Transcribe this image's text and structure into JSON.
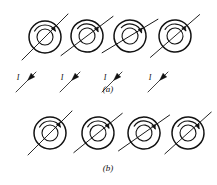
{
  "figure": {
    "type": "physics-diagram",
    "background_color": "#ffffff",
    "stroke_color": "#111111",
    "panels": [
      {
        "id": "a",
        "caption": "(a)",
        "caption_x": 108,
        "caption_y": 89,
        "row_center_y": 37,
        "has_current_arrows": true,
        "current_label": "I",
        "dipoles": [
          {
            "cx": 45,
            "cy": 37,
            "outer_r": 16,
            "inner_r": 8,
            "axis_angle_deg": -45,
            "axis_x1": 22,
            "axis_y1": 60,
            "axis_x2": 68,
            "axis_y2": 14,
            "arc_start_deg": 210,
            "arc_end_deg": 330,
            "arc_r": 12,
            "tilt_deg": 0
          },
          {
            "cx": 87,
            "cy": 36,
            "outer_r": 16,
            "inner_r": 8,
            "axis_angle_deg": -45,
            "axis_x1": 64,
            "axis_y1": 59,
            "axis_x2": 110,
            "axis_y2": 13,
            "arc_start_deg": 210,
            "arc_end_deg": 330,
            "arc_r": 12,
            "tilt_deg": 8
          },
          {
            "cx": 130,
            "cy": 36,
            "outer_r": 16,
            "inner_r": 8,
            "axis_angle_deg": -45,
            "axis_x1": 107,
            "axis_y1": 59,
            "axis_x2": 153,
            "axis_y2": 13,
            "arc_start_deg": 210,
            "arc_end_deg": 330,
            "arc_r": 12,
            "tilt_deg": 14
          },
          {
            "cx": 175,
            "cy": 36,
            "outer_r": 16,
            "inner_r": 8,
            "axis_angle_deg": -45,
            "axis_x1": 152,
            "axis_y1": 59,
            "axis_x2": 198,
            "axis_y2": 13,
            "arc_start_deg": 210,
            "arc_end_deg": 330,
            "arc_r": 12,
            "tilt_deg": 4
          }
        ],
        "current_arrows": [
          {
            "x1": 36,
            "y1": 72,
            "x2": 16,
            "y2": 92,
            "label_x": 14,
            "label_y": 73
          },
          {
            "x1": 80,
            "y1": 72,
            "x2": 60,
            "y2": 92,
            "label_x": 58,
            "label_y": 73
          },
          {
            "x1": 122,
            "y1": 72,
            "x2": 102,
            "y2": 92,
            "label_x": 101,
            "label_y": 73
          },
          {
            "x1": 168,
            "y1": 72,
            "x2": 148,
            "y2": 92,
            "label_x": 146,
            "label_y": 73
          }
        ]
      },
      {
        "id": "b",
        "caption": "(b)",
        "caption_x": 108,
        "caption_y": 168,
        "row_center_y": 133,
        "has_current_arrows": false,
        "current_label": "",
        "dipoles": [
          {
            "cx": 50,
            "cy": 133,
            "outer_r": 16,
            "inner_r": 8,
            "axis_angle_deg": -45,
            "axis_x1": 28,
            "axis_y1": 155,
            "axis_x2": 72,
            "axis_y2": 111,
            "arc_start_deg": 210,
            "arc_end_deg": 330,
            "arc_r": 12,
            "tilt_deg": 0
          },
          {
            "cx": 98,
            "cy": 133,
            "outer_r": 16,
            "inner_r": 8,
            "axis_angle_deg": -45,
            "axis_x1": 76,
            "axis_y1": 155,
            "axis_x2": 120,
            "axis_y2": 111,
            "arc_start_deg": 205,
            "arc_end_deg": 330,
            "arc_r": 12,
            "tilt_deg": 6
          },
          {
            "cx": 144,
            "cy": 133,
            "outer_r": 16,
            "inner_r": 8,
            "axis_angle_deg": -45,
            "axis_x1": 122,
            "axis_y1": 155,
            "axis_x2": 166,
            "axis_y2": 111,
            "arc_start_deg": 205,
            "arc_end_deg": 330,
            "arc_r": 12,
            "tilt_deg": 10
          },
          {
            "cx": 188,
            "cy": 133,
            "outer_r": 16,
            "inner_r": 8,
            "axis_angle_deg": -45,
            "axis_x1": 166,
            "axis_y1": 155,
            "axis_x2": 210,
            "axis_y2": 111,
            "arc_start_deg": 210,
            "arc_end_deg": 335,
            "arc_r": 12,
            "tilt_deg": 3
          }
        ],
        "current_arrows": []
      }
    ]
  }
}
